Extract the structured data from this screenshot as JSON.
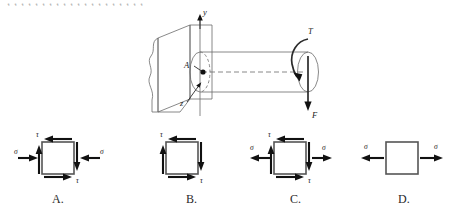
{
  "page": {
    "clipped_header_text": "，，，，，，，，，，，，，，，，，，，，",
    "background_color": "#ffffff",
    "ink_color": "#111111"
  },
  "main_figure": {
    "name": "cantilever-shaft-diagram",
    "description": "Circular shaft built into a wall, loaded by torque T and transverse force F at the free end",
    "labels": {
      "axis_y": "y",
      "axis_z": "z",
      "point": "A",
      "torque": "T",
      "force": "F"
    }
  },
  "options": [
    {
      "id": "A",
      "label": "A.",
      "element_name": "stress-element-a",
      "sigma_label": "σ",
      "tau_label": "τ",
      "sigma_direction": "inward",
      "has_shear": true,
      "has_normal": true
    },
    {
      "id": "B",
      "label": "B.",
      "element_name": "stress-element-b",
      "sigma_label": "",
      "tau_label": "τ",
      "sigma_direction": "none",
      "has_shear": true,
      "has_normal": false
    },
    {
      "id": "C",
      "label": "C.",
      "element_name": "stress-element-c",
      "sigma_label": "σ",
      "tau_label": "τ",
      "sigma_direction": "outward",
      "has_shear": true,
      "has_normal": true
    },
    {
      "id": "D",
      "label": "D.",
      "element_name": "stress-element-d",
      "sigma_label": "σ",
      "tau_label": "",
      "sigma_direction": "outward",
      "has_shear": false,
      "has_normal": true
    }
  ]
}
